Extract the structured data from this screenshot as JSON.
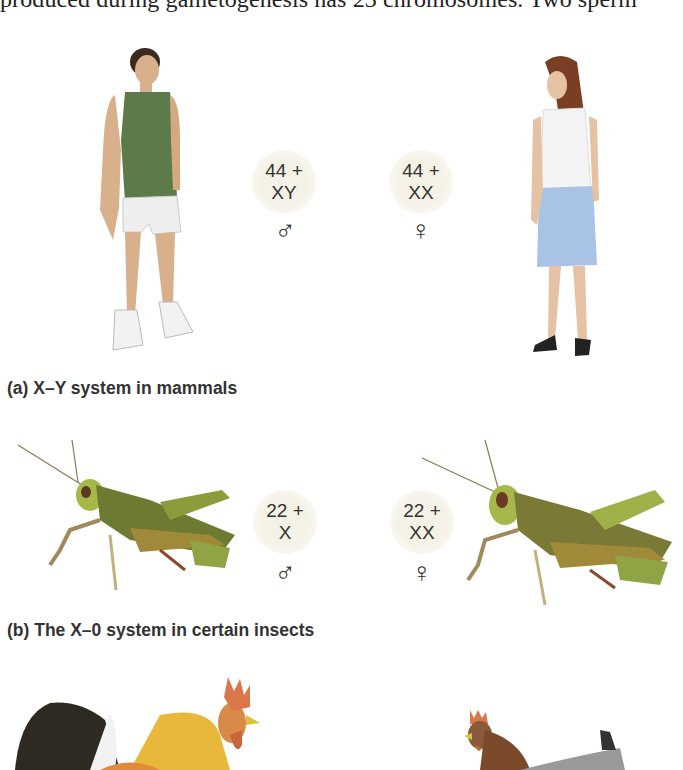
{
  "body_text": "produced during gametogenesis has 23 chromosomes. Two sperm",
  "panels": [
    {
      "id": "a",
      "caption": "(a) X–Y system in mammals",
      "male": {
        "line1": "44 +",
        "line2": "XY",
        "symbol": "♂",
        "figure": "man-illustration"
      },
      "female": {
        "line1": "44 +",
        "line2": "XX",
        "symbol": "♀",
        "figure": "woman-illustration"
      }
    },
    {
      "id": "b",
      "caption": "(b) The X–0 system in certain insects",
      "male": {
        "line1": "22 +",
        "line2": "X",
        "symbol": "♂",
        "figure": "male-grasshopper-illustration"
      },
      "female": {
        "line1": "22 +",
        "line2": "XX",
        "symbol": "♀",
        "figure": "female-grasshopper-illustration"
      }
    },
    {
      "id": "c",
      "male": {
        "figure": "rooster-illustration"
      },
      "female": {
        "figure": "hen-illustration"
      }
    }
  ],
  "colors": {
    "badge": "#f3f1e4",
    "text": "#333333"
  }
}
